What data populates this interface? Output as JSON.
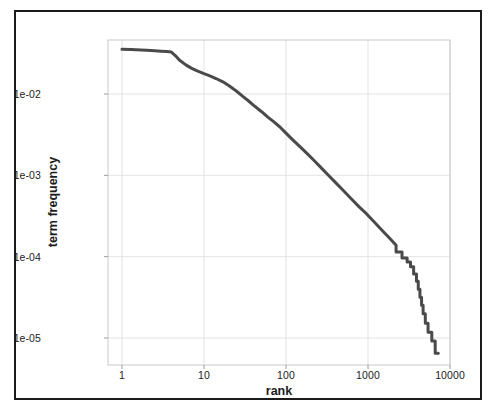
{
  "figure": {
    "frame_border_color": "#1a1a1a",
    "background_color": "#ffffff"
  },
  "chart_data": {
    "type": "line",
    "title": "",
    "subtitle": "",
    "xlabel": "rank",
    "ylabel": "term frequency",
    "xscale": "log",
    "yscale": "log",
    "xlim": [
      1,
      10000
    ],
    "ylim": [
      5e-06,
      0.055
    ],
    "grid": true,
    "legend": null,
    "legend_position": "none",
    "line_color": "#4a4a4a",
    "line_width": 3,
    "panel_border_color": "#c8c8c8",
    "gridline_color": "#e2e2e8",
    "xticks": [
      1,
      10,
      100,
      1000,
      10000
    ],
    "xtick_labels": [
      "1",
      "10",
      "100",
      "1000",
      "10000"
    ],
    "yticks": [
      0.01,
      0.001,
      0.0001,
      1e-05
    ],
    "ytick_labels": [
      "1e-02",
      "1e-03",
      "1e-04",
      "1e-05"
    ],
    "series": [
      {
        "name": "term frequency",
        "x": [
          1,
          1.3,
          1.7,
          2,
          2.5,
          3,
          3.5,
          4,
          4.5,
          5,
          6,
          7,
          8,
          9,
          10,
          12,
          14,
          17,
          20,
          25,
          30,
          35,
          40,
          50,
          60,
          70,
          85,
          100,
          120,
          150,
          180,
          220,
          260,
          320,
          400,
          500,
          620,
          780,
          950,
          1200,
          1500,
          1800,
          2200,
          2600,
          3000,
          3300,
          3600,
          3900,
          4100,
          4300,
          4500,
          4700,
          5000,
          5400,
          6000,
          6600,
          7200
        ],
        "y": [
          0.0355,
          0.0352,
          0.0348,
          0.0345,
          0.034,
          0.0336,
          0.0332,
          0.0328,
          0.0295,
          0.0262,
          0.0228,
          0.0208,
          0.0195,
          0.0186,
          0.0178,
          0.0166,
          0.0155,
          0.0141,
          0.0127,
          0.0108,
          0.0093,
          0.0082,
          0.0073,
          0.0061,
          0.0052,
          0.0046,
          0.0039,
          0.0033,
          0.00275,
          0.00222,
          0.00186,
          0.00152,
          0.00128,
          0.00103,
          0.00082,
          0.00065,
          0.00052,
          0.00041,
          0.00034,
          0.000265,
          0.000208,
          0.000172,
          0.000138,
          0.000114,
          9.65e-05,
          8.62e-05,
          7.52e-05,
          6.12e-05,
          4.98e-05,
          3.98e-05,
          3.18e-05,
          2.52e-05,
          1.98e-05,
          1.52e-05,
          1.18e-05,
          9.2e-06,
          6.5e-06
        ]
      }
    ]
  },
  "axes": {
    "x_title": "rank",
    "y_title": "term frequency"
  }
}
